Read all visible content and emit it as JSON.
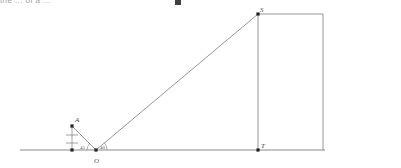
{
  "header": {
    "clipped_text": "the ... of a ...",
    "has_cursor_block": true
  },
  "diagram": {
    "stroke_color": "#8a8a8a",
    "point_color": "#222222",
    "label_color": "#4a4a4a",
    "points": [
      {
        "id": "A",
        "name": "point-a",
        "label": "A",
        "x": 72,
        "y": 126,
        "dot": true,
        "label_dx": 3,
        "label_dy": -9
      },
      {
        "id": "B",
        "name": "point-a-foot",
        "label": "",
        "x": 72,
        "y": 150,
        "dot": true,
        "label_dx": 0,
        "label_dy": 0
      },
      {
        "id": "O",
        "name": "point-o",
        "label": "O",
        "x": 96,
        "y": 150,
        "dot": true,
        "label_dx": -2,
        "label_dy": 8
      },
      {
        "id": "S",
        "name": "point-s",
        "label": "S",
        "x": 258,
        "y": 14,
        "dot": true,
        "label_dx": 2,
        "label_dy": -7
      },
      {
        "id": "T",
        "name": "point-t",
        "label": "T",
        "x": 258,
        "y": 150,
        "dot": true,
        "label_dx": 3,
        "label_dy": -7
      },
      {
        "id": "R",
        "name": "point-r-corner",
        "label": "",
        "x": 323,
        "y": 14,
        "dot": false,
        "label_dx": 0,
        "label_dy": 0
      },
      {
        "id": "G",
        "name": "point-g-ground",
        "label": "",
        "x": 323,
        "y": 150,
        "dot": false,
        "label_dx": 0,
        "label_dy": 0
      }
    ],
    "segments": [
      {
        "name": "ground-line",
        "x1": 20,
        "y1": 150,
        "x2": 325,
        "y2": 150,
        "width": 1.1
      },
      {
        "name": "segment-o-s",
        "x1": 96,
        "y1": 150,
        "x2": 258,
        "y2": 14,
        "width": 0.9
      },
      {
        "name": "segment-o-a",
        "x1": 96,
        "y1": 150,
        "x2": 72,
        "y2": 126,
        "width": 0.9
      },
      {
        "name": "segment-a-foot",
        "x1": 72,
        "y1": 126,
        "x2": 72,
        "y2": 150,
        "width": 0.8
      },
      {
        "name": "segment-s-t",
        "x1": 258,
        "y1": 14,
        "x2": 258,
        "y2": 150,
        "width": 0.9
      },
      {
        "name": "segment-s-r-top",
        "x1": 258,
        "y1": 14,
        "x2": 323,
        "y2": 14,
        "width": 0.9
      },
      {
        "name": "segment-r-g-right",
        "x1": 323,
        "y1": 14,
        "x2": 323,
        "y2": 150,
        "width": 0.9
      }
    ],
    "tick_marks": [
      {
        "name": "tick-upper-a-leg",
        "x1": 66,
        "y1": 135,
        "x2": 78,
        "y2": 135,
        "width": 0.8
      },
      {
        "name": "tick-lower-a-leg",
        "x1": 66,
        "y1": 143,
        "x2": 78,
        "y2": 143,
        "width": 0.8
      }
    ],
    "angles": [
      {
        "name": "angle-left-at-o",
        "label": "45",
        "cx": 96,
        "cy": 150,
        "radius": 9,
        "start_deg": 135,
        "end_deg": 180,
        "label_x": 80,
        "label_y": 145
      },
      {
        "name": "angle-right-at-o",
        "label": "40",
        "cx": 96,
        "cy": 150,
        "radius": 11,
        "start_deg": 0,
        "end_deg": 40,
        "label_x": 100,
        "label_y": 145
      }
    ]
  }
}
